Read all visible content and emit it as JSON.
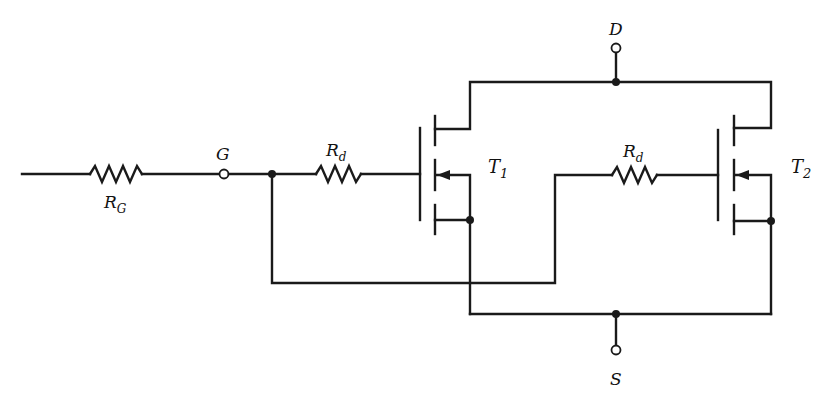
{
  "diagram": {
    "type": "circuit-schematic",
    "terminals": {
      "gate": "G",
      "drain": "D",
      "source": "S"
    },
    "resistors": {
      "gate_common": {
        "main": "R",
        "sub": "G"
      },
      "gate_t1": {
        "main": "R",
        "sub": "d"
      },
      "gate_t2": {
        "main": "R",
        "sub": "d"
      }
    },
    "transistors": {
      "t1": {
        "main": "T",
        "sub": "1"
      },
      "t2": {
        "main": "T",
        "sub": "2"
      }
    },
    "colors": {
      "line": "#1a1a1a",
      "background": "#ffffff"
    }
  }
}
